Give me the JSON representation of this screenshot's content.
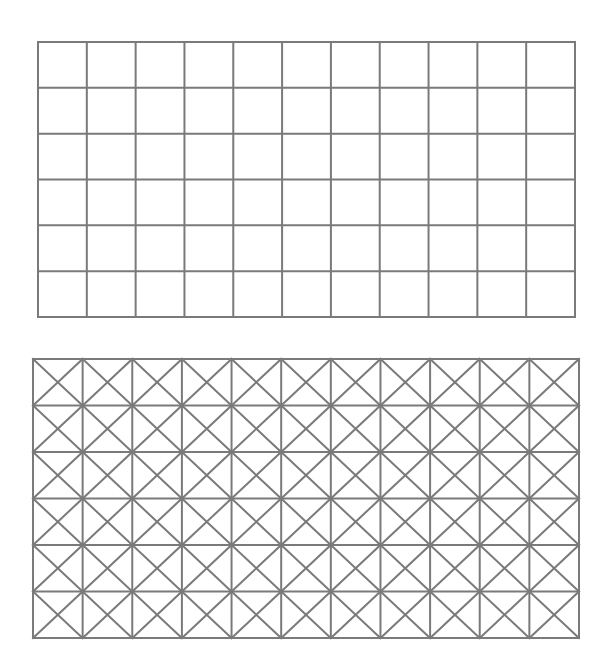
{
  "canvas": {
    "width": 608,
    "height": 669,
    "background": "#ffffff"
  },
  "style": {
    "line_color": "#7a7a7a",
    "line_width": 2
  },
  "grids": [
    {
      "name": "plain-grid",
      "x": 38,
      "y": 42,
      "width": 537,
      "height": 275,
      "columns": 11,
      "rows": 6,
      "diagonals": false
    },
    {
      "name": "cross-braced-grid",
      "x": 33,
      "y": 359,
      "width": 546,
      "height": 279,
      "columns": 11,
      "rows": 6,
      "diagonals": true
    }
  ]
}
